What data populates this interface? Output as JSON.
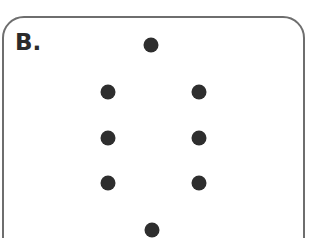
{
  "panel": {
    "label": "B.",
    "border_color": "#6e6e6e",
    "dot_color": "#2e2e2e"
  },
  "dots": [
    {
      "x": 151,
      "y": 45
    },
    {
      "x": 108,
      "y": 92
    },
    {
      "x": 199,
      "y": 92
    },
    {
      "x": 108,
      "y": 138
    },
    {
      "x": 199,
      "y": 138
    },
    {
      "x": 108,
      "y": 183
    },
    {
      "x": 199,
      "y": 183
    },
    {
      "x": 152,
      "y": 230
    }
  ]
}
